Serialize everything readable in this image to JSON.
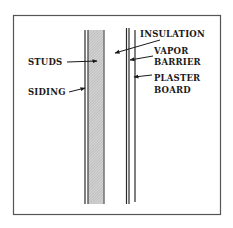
{
  "diagram": {
    "labels": {
      "insulation": "INSULATION",
      "studs": "STUDS",
      "vapor_barrier_1": "VAPOR",
      "vapor_barrier_2": "BARRIER",
      "siding": "SIDING",
      "plaster_board_1": "PLASTER",
      "plaster_board_2": "BOARD"
    },
    "colors": {
      "line": "#2a2a2a",
      "frame": "#555555",
      "stud_fill": "#c8c8c8"
    }
  }
}
